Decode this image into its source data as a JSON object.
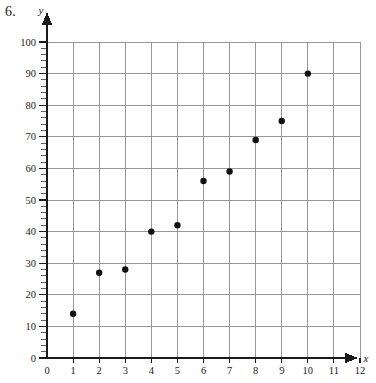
{
  "problem": {
    "number_label": "6."
  },
  "chart_data": {
    "type": "scatter",
    "title": "",
    "xlabel": "x",
    "ylabel": "y",
    "x": [
      1,
      2,
      3,
      4,
      5,
      6,
      7,
      8,
      9,
      10
    ],
    "values": [
      14,
      27,
      28,
      40,
      42,
      56,
      59,
      69,
      75,
      90
    ],
    "points": [
      {
        "x": 1,
        "y": 14
      },
      {
        "x": 2,
        "y": 27
      },
      {
        "x": 3,
        "y": 28
      },
      {
        "x": 4,
        "y": 40
      },
      {
        "x": 5,
        "y": 42
      },
      {
        "x": 6,
        "y": 56
      },
      {
        "x": 7,
        "y": 59
      },
      {
        "x": 8,
        "y": 69
      },
      {
        "x": 9,
        "y": 75
      },
      {
        "x": 10,
        "y": 90
      }
    ],
    "xlim": [
      0,
      12
    ],
    "ylim": [
      0,
      100
    ],
    "xticks": [
      0,
      1,
      2,
      3,
      4,
      5,
      6,
      7,
      8,
      9,
      10,
      11,
      12
    ],
    "yticks": [
      0,
      10,
      20,
      30,
      40,
      50,
      60,
      70,
      80,
      90,
      100
    ],
    "xtick_labels": [
      "0",
      "1",
      "2",
      "3",
      "4",
      "5",
      "6",
      "7",
      "8",
      "9",
      "10",
      "11",
      "12"
    ],
    "ytick_labels": [
      "0",
      "10",
      "20",
      "30",
      "40",
      "50",
      "60",
      "70",
      "80",
      "90",
      "100"
    ],
    "grid": true,
    "legend": null,
    "y_minor_tick_step": 2,
    "colors": {
      "point": "#111111",
      "grid": "#8c8c8c",
      "axis": "#1a1a1a",
      "background": "#ffffff"
    }
  }
}
